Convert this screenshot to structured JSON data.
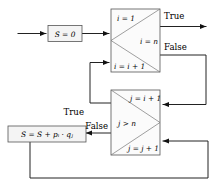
{
  "diagram": {
    "canvas": {
      "width": 219,
      "height": 186
    },
    "colors": {
      "background": "#ffffff",
      "box_fill": "#f4f4f4",
      "box_stroke": "#555555",
      "triangle_stroke": "#777777",
      "connector": "#222222",
      "text": "#000000"
    },
    "nodes": {
      "init": {
        "label": "S = 0"
      },
      "outer_loop": {
        "top_label": "i = 1",
        "condition_label": "i = n",
        "bottom_label": "i = i + 1"
      },
      "inner_loop": {
        "top_label": "j = i + 1",
        "condition_label": "j > n",
        "bottom_label": "j = j + 1"
      },
      "accumulate": {
        "label": "S = S + pᵢ · qⱼ"
      }
    },
    "edge_labels": {
      "outer_true": "True",
      "outer_false": "False",
      "inner_true": "True",
      "inner_false": "False"
    }
  }
}
